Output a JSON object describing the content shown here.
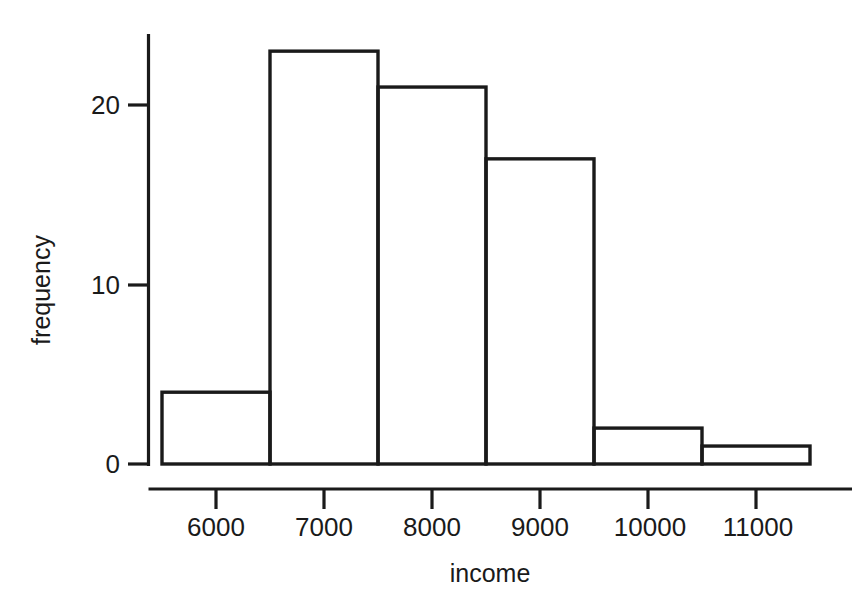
{
  "chart_data": {
    "type": "bar",
    "title": "",
    "subtitle": "",
    "xlabel": "income",
    "ylabel": "frequency",
    "categories": [
      "5500-6500",
      "6500-7500",
      "7500-8500",
      "8500-9500",
      "9500-10500",
      "10500-11500"
    ],
    "bin_edges": [
      5500,
      6500,
      7500,
      8500,
      9500,
      10500,
      11500
    ],
    "values": [
      4,
      23,
      21,
      17,
      2,
      1
    ],
    "xlim": [
      5450,
      11650
    ],
    "ylim": [
      0,
      24.5
    ],
    "xticks": [
      6000,
      7000,
      8000,
      9000,
      10000,
      11000
    ],
    "xtick_labels": [
      "6000",
      "7000",
      "8000",
      "9000",
      "10000",
      "11000"
    ],
    "yticks": [
      0,
      10,
      20
    ],
    "ytick_labels": [
      "0",
      "10",
      "20"
    ],
    "grid": false,
    "legend": null,
    "bar_fill": "#ffffff",
    "bar_stroke": "#1a1a1a",
    "axis_color": "#1a1a1a",
    "background": "#ffffff"
  },
  "labels": {
    "y_axis_title": "frequency",
    "x_axis_title": "income",
    "ytick_0": "0",
    "ytick_10": "10",
    "ytick_20": "20",
    "xtick_6000": "6000",
    "xtick_7000": "7000",
    "xtick_8000": "8000",
    "xtick_9000": "9000",
    "xtick_10000": "10000",
    "xtick_11000": "11000"
  }
}
